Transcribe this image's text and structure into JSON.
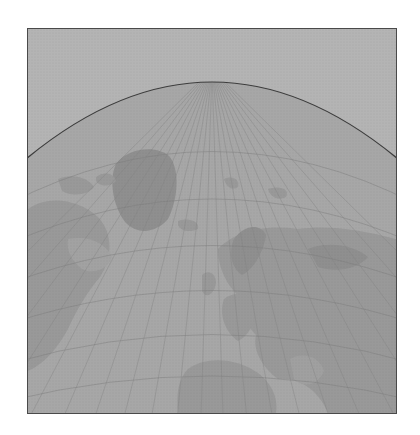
{
  "map": {
    "type": "world-projection",
    "style": "grayscale-halftone",
    "labels": [],
    "colors": {
      "background": "#ffffff",
      "frame_border": "#4a4a4a",
      "outer_space": "#b4b4b4",
      "ocean": "#a7a7a7",
      "land": "#999999",
      "land_dark": "#8f8f8f",
      "graticule": "#858585",
      "horizon_line": "#3c3c3c"
    },
    "frame": {
      "x": 27,
      "y": 28,
      "width": 370,
      "height": 386
    },
    "horizon": {
      "apex_x": 212,
      "apex_y": 81,
      "edge_y": 157
    },
    "graticule": {
      "meridian_count": 36,
      "parallel_count": 7
    }
  }
}
